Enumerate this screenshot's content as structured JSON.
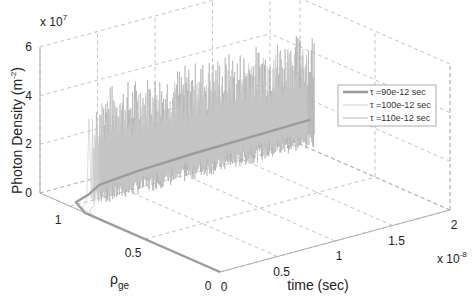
{
  "chart_data": {
    "type": "line3d",
    "title": "",
    "xlabel": "time (sec)",
    "ylabel": "ρ_ge",
    "zlabel": "Photon Density (m^-2)",
    "x_axis": {
      "label": "time (sec)",
      "ticks": [
        "0",
        "0.5",
        "1",
        "1.5",
        "2"
      ],
      "tick_values": [
        0,
        5e-09,
        1e-08,
        1.5e-08,
        2e-08
      ],
      "exponent_label": "x 10",
      "exponent": "-8",
      "range": [
        0,
        2e-08
      ]
    },
    "y_axis": {
      "label": "ρ",
      "label_sub": "ge",
      "ticks": [
        "0",
        "0.5",
        "1"
      ],
      "tick_values": [
        0,
        0.5,
        1
      ],
      "range": [
        0,
        1.2
      ]
    },
    "z_axis": {
      "label": "Photon Density (m",
      "label_sup": "-2",
      "label_end": ")",
      "ticks": [
        "0",
        "2",
        "4",
        "6"
      ],
      "tick_values": [
        0,
        20000000.0,
        40000000.0,
        60000000.0
      ],
      "exponent_label": "x 10",
      "exponent": "7",
      "range": [
        0,
        60000000.0
      ]
    },
    "grid": true,
    "legend_position": "inside-right",
    "series": [
      {
        "name": "τ =90e-12 sec",
        "style": "thick gray",
        "description": "Settles quickly to a near-steady photon density",
        "points_time_rho_density": [
          [
            0,
            0,
            0
          ],
          [
            0,
            0.9,
            0
          ],
          [
            5e-10,
            1.0,
            1000000.0
          ],
          [
            1e-09,
            0.95,
            5000000.0
          ],
          [
            1.5e-09,
            0.92,
            9000000.0
          ],
          [
            5e-09,
            0.93,
            10000000.0
          ],
          [
            1e-08,
            0.93,
            11000000.0
          ],
          [
            1.5e-08,
            0.93,
            11500000.0
          ],
          [
            2e-08,
            0.93,
            12000000.0
          ]
        ]
      },
      {
        "name": "τ =100e-12 sec",
        "style": "thin light gray",
        "description": "Strong oscillation (self-pulsation), peaks up to ~4-5e7",
        "envelope_max": 45000000.0,
        "envelope_min": 2000000.0
      },
      {
        "name": "τ =110e-12 sec",
        "style": "thin gray",
        "description": "Strong oscillation (self-pulsation), initial spike ~4e7 then sustained",
        "envelope_max": 50000000.0,
        "envelope_min": 2000000.0
      }
    ]
  },
  "legend": {
    "items": [
      {
        "label": "τ =90e-12 sec",
        "color": "#9c9c9c",
        "width": 2.6
      },
      {
        "label": "τ =100e-12 sec",
        "color": "#c4c4c4",
        "width": 0.8
      },
      {
        "label": "τ =110e-12 sec",
        "color": "#a9a9a9",
        "width": 0.8
      }
    ]
  },
  "colors": {
    "grid": "#b5b5b5",
    "axis": "#a8a8a8",
    "text": "#222222"
  }
}
